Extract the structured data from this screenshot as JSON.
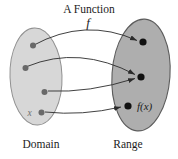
{
  "diagram": {
    "title": "A Function",
    "function_label": "f",
    "domain_label": "Domain",
    "range_label": "Range",
    "input_label": "x",
    "output_label": "f(x)",
    "colors": {
      "background": "#ffffff",
      "domain_fill": "#d7d7d7",
      "domain_stroke": "#909090",
      "range_fill": "#aeaeae",
      "range_stroke": "#5c5c5c",
      "domain_dot": "#696969",
      "range_dot": "#111111",
      "arrow": "#2b2b2b",
      "text": "#1c1c1c",
      "input_label_color": "#6f6f6f"
    },
    "domain_ellipse": {
      "cx": 36,
      "cy": 76.5,
      "rx": 26,
      "ry": 48.5,
      "rotate": -2
    },
    "range_ellipse": {
      "cx": 141,
      "cy": 75,
      "rx": 29,
      "ry": 56,
      "rotate": 4
    },
    "domain_points": [
      [
        33,
        45.5
      ],
      [
        25.5,
        68
      ],
      [
        44.5,
        92
      ],
      [
        41.5,
        112.5
      ]
    ],
    "range_points": [
      [
        143,
        42
      ],
      [
        141,
        77
      ],
      [
        128,
        106
      ]
    ],
    "arrows": [
      {
        "from": [
          33,
          45.5
        ],
        "ctrl": [
          85,
          17
        ],
        "to": [
          137,
          40.5
        ]
      },
      {
        "from": [
          27,
          66.5
        ],
        "ctrl": [
          79,
          45
        ],
        "to": [
          135,
          74.5
        ]
      },
      {
        "from": [
          48,
          91
        ],
        "ctrl": [
          89,
          93
        ],
        "to": [
          135,
          78.5
        ]
      },
      {
        "from": [
          45,
          112
        ],
        "ctrl": [
          82,
          116
        ],
        "to": [
          121,
          107
        ]
      }
    ]
  }
}
